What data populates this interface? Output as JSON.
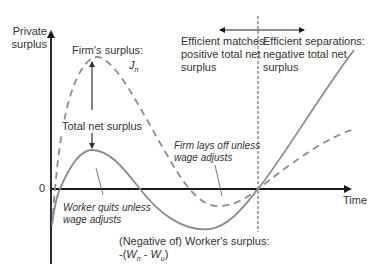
{
  "diagram": {
    "y_axis_label_line1": "Private",
    "y_axis_label_line2": "surplus",
    "x_axis_label": "Time",
    "zero_label": "0",
    "firm_surplus_line1": "Firm's surplus:",
    "firm_surplus_symbol": "J",
    "firm_surplus_sub": "n",
    "total_net_surplus": "Total net surplus",
    "efficient_matches_line1": "Efficient matches:",
    "efficient_matches_line2": "positive total net",
    "efficient_matches_line3": "surplus",
    "efficient_separations_line1": "Efficient separations:",
    "efficient_separations_line2": "negative total net",
    "efficient_separations_line3": "surplus",
    "firm_lays_off_line1": "Firm lays off unless",
    "firm_lays_off_line2": "wage adjusts",
    "worker_quits_line1": "Worker quits unless",
    "worker_quits_line2": "wage adjusts",
    "worker_surplus_line1": "(Negative of) Worker's surplus:",
    "worker_surplus_formula_prefix": "-(",
    "worker_surplus_W1": "W",
    "worker_surplus_sub1": "n",
    "worker_surplus_minus": " - ",
    "worker_surplus_W2": "W",
    "worker_surplus_sub2": "u",
    "worker_surplus_formula_suffix": ")"
  },
  "colors": {
    "axis": "#1a1a1a",
    "curve": "#8c8c8c",
    "text": "#333333"
  }
}
